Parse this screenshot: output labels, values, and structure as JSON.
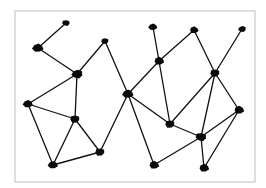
{
  "diagram": {
    "type": "network-graph",
    "style": "hand-drawn",
    "colors": {
      "background": "#ffffff",
      "frame": "#bdbdbd",
      "edge": "#111111",
      "node": "#0a0a0a"
    },
    "frame": {
      "x": 15,
      "y": 11,
      "width": 240,
      "height": 171
    },
    "nodes": [
      {
        "id": "n1",
        "x": 66,
        "y": 23,
        "r": 3.5
      },
      {
        "id": "n2",
        "x": 38,
        "y": 48,
        "r": 5
      },
      {
        "id": "n3",
        "x": 77,
        "y": 74,
        "r": 5
      },
      {
        "id": "n4",
        "x": 105,
        "y": 41,
        "r": 3.5
      },
      {
        "id": "n5",
        "x": 28,
        "y": 104,
        "r": 4.5
      },
      {
        "id": "n6",
        "x": 75,
        "y": 119,
        "r": 4.5
      },
      {
        "id": "n7",
        "x": 100,
        "y": 152,
        "r": 4.5
      },
      {
        "id": "n8",
        "x": 53,
        "y": 165,
        "r": 4.5
      },
      {
        "id": "n9",
        "x": 128,
        "y": 94,
        "r": 5
      },
      {
        "id": "n10",
        "x": 153,
        "y": 27,
        "r": 4
      },
      {
        "id": "n11",
        "x": 159,
        "y": 61,
        "r": 4.5
      },
      {
        "id": "n12",
        "x": 194,
        "y": 30,
        "r": 4
      },
      {
        "id": "n13",
        "x": 242,
        "y": 29,
        "r": 3.5
      },
      {
        "id": "n14",
        "x": 215,
        "y": 73,
        "r": 4.5
      },
      {
        "id": "n15",
        "x": 239,
        "y": 110,
        "r": 4.5
      },
      {
        "id": "n16",
        "x": 170,
        "y": 124,
        "r": 4.5
      },
      {
        "id": "n17",
        "x": 201,
        "y": 137,
        "r": 5
      },
      {
        "id": "n18",
        "x": 154,
        "y": 165,
        "r": 4.5
      },
      {
        "id": "n19",
        "x": 204,
        "y": 168,
        "r": 4.5
      }
    ],
    "edges": [
      [
        "n1",
        "n2"
      ],
      [
        "n2",
        "n3"
      ],
      [
        "n3",
        "n4"
      ],
      [
        "n3",
        "n5"
      ],
      [
        "n3",
        "n6"
      ],
      [
        "n4",
        "n9"
      ],
      [
        "n5",
        "n6"
      ],
      [
        "n5",
        "n8"
      ],
      [
        "n6",
        "n8"
      ],
      [
        "n6",
        "n7"
      ],
      [
        "n7",
        "n8"
      ],
      [
        "n7",
        "n9"
      ],
      [
        "n9",
        "n11"
      ],
      [
        "n9",
        "n16"
      ],
      [
        "n9",
        "n18"
      ],
      [
        "n10",
        "n11"
      ],
      [
        "n11",
        "n12"
      ],
      [
        "n11",
        "n16"
      ],
      [
        "n12",
        "n14"
      ],
      [
        "n13",
        "n14"
      ],
      [
        "n14",
        "n16"
      ],
      [
        "n14",
        "n17"
      ],
      [
        "n14",
        "n15"
      ],
      [
        "n15",
        "n17"
      ],
      [
        "n15",
        "n19"
      ],
      [
        "n16",
        "n17"
      ],
      [
        "n17",
        "n18"
      ],
      [
        "n17",
        "n19"
      ]
    ]
  }
}
